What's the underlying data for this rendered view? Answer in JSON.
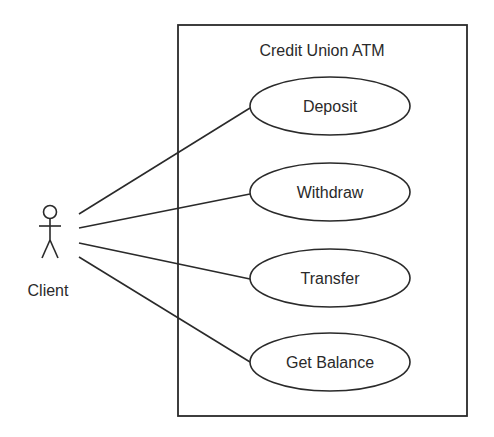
{
  "diagram": {
    "type": "uml-use-case",
    "system": {
      "title": "Credit Union ATM"
    },
    "actor": {
      "name": "Client"
    },
    "use_cases": [
      {
        "label": "Deposit"
      },
      {
        "label": "Withdraw"
      },
      {
        "label": "Transfer"
      },
      {
        "label": "Get Balance"
      }
    ],
    "colors": {
      "stroke": "#2a2a2a",
      "background": "#ffffff"
    }
  }
}
